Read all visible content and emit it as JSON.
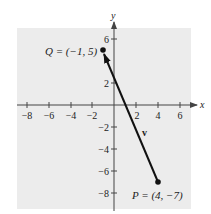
{
  "figure": {
    "background_color": "#ffffff",
    "plot_background_color": "#ececec",
    "axis_color": "#444444",
    "vector_color": "#111111"
  },
  "axes": {
    "x_label": "x",
    "y_label": "y",
    "x_ticks": [
      -8,
      -6,
      -4,
      -2,
      2,
      4,
      6
    ],
    "x_tick_labels": [
      "−8",
      "−6",
      "−4",
      "−2",
      "2",
      "4",
      "6"
    ],
    "y_ticks": [
      6,
      2,
      -2,
      -4,
      -6,
      -8
    ],
    "y_tick_labels": [
      "6",
      "2",
      "−2",
      "−4",
      "−6",
      "−8"
    ]
  },
  "points": {
    "Q": {
      "label": "Q = (−1, 5)",
      "x": -1,
      "y": 5
    },
    "P": {
      "label": "P = (4, −7)",
      "x": 4,
      "y": -7
    }
  },
  "vector": {
    "label": "v",
    "from": "P",
    "to": "Q"
  }
}
